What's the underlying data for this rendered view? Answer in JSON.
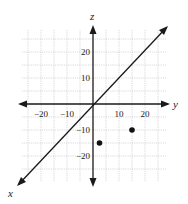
{
  "figure": {
    "axes": {
      "x_label": "x",
      "y_label": "y",
      "z_label": "z"
    },
    "y_ticks": [
      {
        "value": -20,
        "label": "−20"
      },
      {
        "value": -10,
        "label": "−10"
      },
      {
        "value": 10,
        "label": "10"
      },
      {
        "value": 20,
        "label": "20"
      }
    ],
    "z_ticks": [
      {
        "value": 20,
        "label": "20"
      },
      {
        "value": 10,
        "label": "10"
      },
      {
        "value": -10,
        "label": "−10"
      },
      {
        "value": -20,
        "label": "−20"
      }
    ],
    "grid_step": 5,
    "points": [
      {
        "y": 2.5,
        "z": -15
      },
      {
        "y": 15,
        "z": -10
      }
    ],
    "colors": {
      "grid": "#c8c8c8",
      "axis": "#1a1a1a",
      "point": "#111111"
    }
  }
}
